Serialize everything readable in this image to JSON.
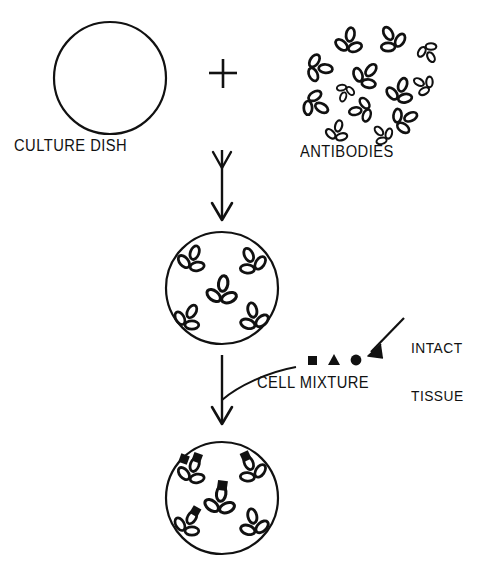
{
  "figure": {
    "background_color": "#ffffff",
    "ink_color": "#111111",
    "width": 494,
    "height": 571
  },
  "labels": {
    "culture_dish": "CULTURE DISH",
    "antibodies": "ANTIBODIES",
    "cell_mixture": "CELL MIXTURE",
    "intact_tissue_line1": "INTACT",
    "intact_tissue_line2": "TISSUE",
    "plus_sign": "+"
  },
  "steps": [
    {
      "id": "step-1",
      "name": "combine",
      "left_item": "culture-dish",
      "operator": "+",
      "right_item": "antibodies"
    },
    {
      "id": "step-2",
      "name": "antibody-coated-dish",
      "item": "dish-with-antibodies",
      "antibody_count": 5
    },
    {
      "id": "step-3",
      "name": "cells-bound-to-antibodies",
      "item": "dish-with-bound-cells",
      "antibody_count": 5,
      "bound_cell_count": 4
    }
  ],
  "dishes": {
    "empty_dish": {
      "cx": 110,
      "cy": 78,
      "r": 56,
      "stroke_width": 2.2,
      "antibodies": []
    },
    "antibody_dish": {
      "cx": 222,
      "cy": 288,
      "r": 56,
      "stroke_width": 2.2,
      "antibodies": [
        {
          "cx": 192,
          "cy": 260,
          "rot": 20,
          "scale": 0.82,
          "cell": null
        },
        {
          "cx": 252,
          "cy": 262,
          "rot": -25,
          "scale": 0.82,
          "cell": null
        },
        {
          "cx": 222,
          "cy": 292,
          "rot": 8,
          "scale": 0.9,
          "cell": null
        },
        {
          "cx": 188,
          "cy": 318,
          "rot": 30,
          "scale": 0.8,
          "cell": null
        },
        {
          "cx": 254,
          "cy": 318,
          "rot": -12,
          "scale": 0.85,
          "cell": null
        }
      ]
    },
    "cell_dish": {
      "cx": 222,
      "cy": 498,
      "r": 56,
      "stroke_width": 2.2,
      "antibodies": [
        {
          "cx": 192,
          "cy": 472,
          "rot": 20,
          "scale": 0.82,
          "cell": "square-double"
        },
        {
          "cx": 252,
          "cy": 470,
          "rot": -25,
          "scale": 0.82,
          "cell": "square"
        },
        {
          "cx": 220,
          "cy": 502,
          "rot": 8,
          "scale": 0.9,
          "cell": "square"
        },
        {
          "cx": 188,
          "cy": 524,
          "rot": 30,
          "scale": 0.8,
          "cell": "square"
        },
        {
          "cx": 254,
          "cy": 524,
          "rot": -12,
          "scale": 0.85,
          "cell": null
        }
      ]
    }
  },
  "antibody_cluster": {
    "count": 13,
    "items": [
      {
        "cx": 349,
        "cy": 42,
        "rot": 10,
        "scale": 0.8
      },
      {
        "cx": 392,
        "cy": 40,
        "rot": -30,
        "scale": 0.8
      },
      {
        "cx": 428,
        "cy": 52,
        "rot": 150,
        "scale": 0.62
      },
      {
        "cx": 318,
        "cy": 68,
        "rot": 95,
        "scale": 0.8
      },
      {
        "cx": 366,
        "cy": 76,
        "rot": 40,
        "scale": 0.8
      },
      {
        "cx": 424,
        "cy": 85,
        "rot": -60,
        "scale": 0.62
      },
      {
        "cx": 400,
        "cy": 92,
        "rot": 20,
        "scale": 0.8
      },
      {
        "cx": 315,
        "cy": 104,
        "rot": 120,
        "scale": 0.8
      },
      {
        "cx": 362,
        "cy": 110,
        "rot": -100,
        "scale": 0.72
      },
      {
        "cx": 404,
        "cy": 120,
        "rot": 65,
        "scale": 0.78
      },
      {
        "cx": 337,
        "cy": 132,
        "rot": 15,
        "scale": 0.66
      },
      {
        "cx": 383,
        "cy": 135,
        "rot": -45,
        "scale": 0.6
      },
      {
        "cx": 345,
        "cy": 92,
        "rot": 200,
        "scale": 0.55
      }
    ]
  },
  "cell_mixture_symbols": [
    {
      "shape": "square",
      "cx": 313,
      "cy": 361,
      "size": 9
    },
    {
      "shape": "triangle",
      "cx": 334,
      "cy": 361,
      "size": 10
    },
    {
      "shape": "circle",
      "cx": 355,
      "cy": 360,
      "size": 10
    }
  ],
  "arrows": [
    {
      "id": "arrow-combine-to-dish",
      "x": 222,
      "y1": 150,
      "y2": 220,
      "heads": 2
    },
    {
      "id": "arrow-dish-to-cells",
      "x": 222,
      "y1": 355,
      "y2": 425,
      "heads": 1
    }
  ],
  "leaders": [
    {
      "id": "leader-cell-mixture",
      "from": "CELL MIXTURE",
      "to": "arrow-dish-to-cells"
    },
    {
      "id": "leader-intact-tissue",
      "from": "INTACT TISSUE",
      "to": "cell-mixture-symbols"
    }
  ]
}
